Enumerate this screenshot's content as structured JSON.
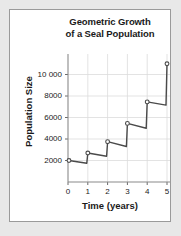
{
  "figure": {
    "title_lines": [
      "Geometric Growth",
      "of a Seal Population"
    ],
    "background_color": "#e8e8e8",
    "card_color": "#ffffff",
    "border_color": "#9a9a9a"
  },
  "chart_data": {
    "type": "line",
    "title": "Geometric Growth of a Seal Population",
    "xlabel": "Time (years)",
    "ylabel": "Population Size",
    "xlim": [
      0,
      5
    ],
    "ylim": [
      0,
      12000
    ],
    "grid": true,
    "legend": null,
    "xticks": [
      0,
      1,
      2,
      3,
      4,
      5
    ],
    "xtick_labels": [
      "0",
      "1",
      "2",
      "3",
      "4",
      "5"
    ],
    "yticks": [
      2000,
      4000,
      6000,
      8000,
      10000
    ],
    "ytick_labels": [
      "2000",
      "4000",
      "6000",
      "8000",
      "10 000"
    ],
    "line_color": "#4a4a4a",
    "marker": "open-circle",
    "x": [
      0.05,
      0.95,
      1.0,
      1.95,
      2.0,
      2.95,
      3.0,
      3.95,
      4.0,
      4.95,
      5.0
    ],
    "y": [
      2000,
      1750,
      2700,
      2400,
      3750,
      3300,
      5450,
      5000,
      7450,
      7150,
      11000
    ],
    "marker_points": [
      {
        "x": 0.05,
        "y": 2000
      },
      {
        "x": 1.0,
        "y": 2700
      },
      {
        "x": 2.0,
        "y": 3750
      },
      {
        "x": 3.0,
        "y": 5450
      },
      {
        "x": 4.0,
        "y": 7450
      },
      {
        "x": 5.0,
        "y": 11000
      }
    ]
  }
}
